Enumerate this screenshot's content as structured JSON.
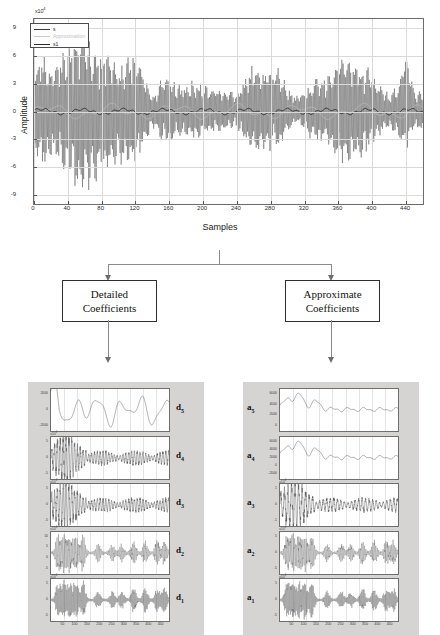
{
  "figure": {
    "caption_absent": true
  },
  "main_chart": {
    "exponent_label": "x10",
    "exponent_sup": "4",
    "ylabel": "Amplitude",
    "xlabel": "Samples",
    "xticks": [
      "0",
      "40",
      "80",
      "120",
      "160",
      "200",
      "240",
      "280",
      "320",
      "360",
      "400",
      "440"
    ],
    "yticks": [
      "9",
      "6",
      "3",
      "0",
      "-3",
      "-6",
      "-9"
    ],
    "legend": [
      {
        "label": "s",
        "color": "#3a3a3a"
      },
      {
        "label": "Approximation",
        "color": "#c9c9c9"
      },
      {
        "label": "s1",
        "color": "#2a2a2a"
      }
    ]
  },
  "flow": {
    "detailed_box": {
      "line1": "Detailed",
      "line2": "Coefficients"
    },
    "approx_box": {
      "line1": "Approximate",
      "line2": "Coefficients"
    }
  },
  "detail_panels": {
    "column_label": "Detailed Coefficients",
    "panels": [
      {
        "tag": "d",
        "sub": "5",
        "exp": "",
        "yticks": [
          "2000",
          "0",
          "-2000"
        ]
      },
      {
        "tag": "d",
        "sub": "4",
        "exp": "x10",
        "exp_sup": "4",
        "yticks": [
          "5",
          "0",
          "-5"
        ]
      },
      {
        "tag": "d",
        "sub": "3",
        "exp": "x10",
        "exp_sup": "4",
        "yticks": [
          "5",
          "0",
          "-5"
        ]
      },
      {
        "tag": "d",
        "sub": "2",
        "exp": "x10",
        "exp_sup": "4",
        "yticks": [
          "10",
          "5",
          "0",
          "-5"
        ]
      },
      {
        "tag": "d",
        "sub": "1",
        "exp": "x10",
        "exp_sup": "4",
        "yticks": [
          "5",
          "0",
          "-5"
        ]
      }
    ],
    "xticks": [
      "50",
      "100",
      "150",
      "200",
      "250",
      "300",
      "350",
      "400",
      "450"
    ]
  },
  "approx_panels": {
    "column_label": "Approximate Coefficients",
    "panels": [
      {
        "tag": "a",
        "sub": "5",
        "exp": "",
        "yticks": [
          "6000",
          "4000",
          "2000",
          "0"
        ]
      },
      {
        "tag": "a",
        "sub": "4",
        "exp": "",
        "yticks": [
          "6000",
          "4000",
          "2000",
          "0",
          "-2000"
        ]
      },
      {
        "tag": "a",
        "sub": "3",
        "exp": "x10",
        "exp_sup": "4",
        "yticks": [
          "1",
          "0",
          "-1"
        ]
      },
      {
        "tag": "a",
        "sub": "2",
        "exp": "x10",
        "exp_sup": "4",
        "yticks": [
          "5",
          "0",
          "-5"
        ]
      },
      {
        "tag": "a",
        "sub": "1",
        "exp": "x10",
        "exp_sup": "4",
        "yticks": [
          "5",
          "0",
          "-5"
        ]
      }
    ],
    "xticks": [
      "50",
      "100",
      "150",
      "200",
      "250",
      "300",
      "350",
      "400",
      "450"
    ]
  },
  "chart_data": {
    "type": "line",
    "title": "",
    "xlabel": "Samples",
    "ylabel": "Amplitude",
    "xlim": [
      0,
      460
    ],
    "ylim": [
      -10,
      10
    ],
    "y_scale": "x10^4",
    "grid": true,
    "legend_position": "top-left",
    "series": [
      {
        "name": "s",
        "color": "#3a3a3a",
        "description": "Original noisy ECG/vibration signal, oscillatory bursts"
      },
      {
        "name": "Approximation",
        "color": "#c9c9c9",
        "description": "Low-frequency approximation overlay"
      },
      {
        "name": "s1",
        "color": "#2a2a2a",
        "description": "Denoised / reconstructed signal, near-zero baseline"
      }
    ],
    "envelope_x": [
      0,
      10,
      20,
      30,
      40,
      50,
      60,
      70,
      80,
      90,
      100,
      110,
      120,
      130,
      140,
      150,
      160,
      170,
      180,
      190,
      200,
      210,
      220,
      230,
      240,
      250,
      260,
      270,
      280,
      290,
      300,
      310,
      320,
      330,
      340,
      350,
      360,
      370,
      380,
      390,
      400,
      410,
      420,
      430,
      440,
      450
    ],
    "envelope_upper": [
      5.2,
      6.2,
      4.5,
      6.0,
      6.8,
      7.8,
      7.9,
      7.5,
      6.6,
      6.2,
      5.0,
      5.4,
      6.2,
      4.0,
      1.6,
      3.4,
      4.0,
      2.8,
      3.0,
      3.4,
      2.8,
      2.6,
      2.4,
      2.2,
      2.0,
      3.6,
      5.3,
      4.6,
      5.0,
      4.8,
      2.4,
      1.6,
      2.2,
      3.4,
      3.6,
      4.0,
      5.8,
      6.2,
      5.2,
      5.0,
      4.2,
      2.6,
      2.0,
      3.0,
      6.2,
      2.2
    ],
    "envelope_lower": [
      -5.4,
      -6.4,
      -4.6,
      -5.8,
      -7.0,
      -8.2,
      -8.0,
      -7.6,
      -6.8,
      -6.4,
      -5.2,
      -5.6,
      -5.6,
      -4.2,
      -1.6,
      -3.2,
      -3.8,
      -2.6,
      -2.8,
      -3.2,
      -2.6,
      -2.4,
      -2.2,
      -2.0,
      -1.8,
      -3.4,
      -4.6,
      -4.0,
      -4.4,
      -4.2,
      -2.2,
      -1.4,
      -2.0,
      -3.2,
      -3.4,
      -3.8,
      -5.4,
      -5.8,
      -4.8,
      -4.6,
      -4.0,
      -2.4,
      -1.8,
      -2.8,
      -4.6,
      -2.0
    ],
    "subplots": {
      "detail": [
        {
          "name": "d5",
          "ylim": [
            -3000,
            3000
          ]
        },
        {
          "name": "d4",
          "ylim": [
            -6,
            6
          ],
          "y_scale": "x10^4"
        },
        {
          "name": "d3",
          "ylim": [
            -6,
            6
          ],
          "y_scale": "x10^4"
        },
        {
          "name": "d2",
          "ylim": [
            -6,
            12
          ],
          "y_scale": "x10^4"
        },
        {
          "name": "d1",
          "ylim": [
            -6,
            6
          ],
          "y_scale": "x10^4"
        }
      ],
      "approx": [
        {
          "name": "a5",
          "ylim": [
            -500,
            7000
          ]
        },
        {
          "name": "a4",
          "ylim": [
            -2500,
            7000
          ]
        },
        {
          "name": "a3",
          "ylim": [
            -1.5,
            1.5
          ],
          "y_scale": "x10^4"
        },
        {
          "name": "a2",
          "ylim": [
            -6,
            6
          ],
          "y_scale": "x10^4"
        },
        {
          "name": "a1",
          "ylim": [
            -6,
            6
          ],
          "y_scale": "x10^4"
        }
      ]
    }
  }
}
